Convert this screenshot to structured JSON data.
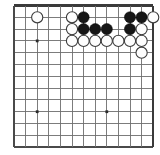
{
  "diagram": {
    "kind": "go-board-diagram",
    "board": {
      "columns": 13,
      "rows": 13,
      "origin_x": 14,
      "origin_y": 5.5,
      "spacing_x": 11.6,
      "spacing_y": 11.8,
      "line_color": "#6e6e6e",
      "edge_color": "#3a3a3a",
      "background_color": "#ffffff"
    },
    "star_points": [
      {
        "col": 2,
        "row": 3
      },
      {
        "col": 2,
        "row": 9
      },
      {
        "col": 8,
        "row": 9
      }
    ],
    "stone_radius": 5.6,
    "stones": [
      {
        "color": "white",
        "col": 2,
        "row": 1
      },
      {
        "color": "white",
        "col": 5,
        "row": 1
      },
      {
        "color": "black",
        "col": 6,
        "row": 1
      },
      {
        "color": "black",
        "col": 10,
        "row": 1
      },
      {
        "color": "black",
        "col": 11,
        "row": 1
      },
      {
        "color": "white",
        "col": 12,
        "row": 1
      },
      {
        "color": "white",
        "col": 5,
        "row": 2
      },
      {
        "color": "black",
        "col": 6,
        "row": 2
      },
      {
        "color": "black",
        "col": 7,
        "row": 2
      },
      {
        "color": "black",
        "col": 8,
        "row": 2
      },
      {
        "color": "black",
        "col": 10,
        "row": 2
      },
      {
        "color": "white",
        "col": 11,
        "row": 2
      },
      {
        "color": "white",
        "col": 5,
        "row": 3
      },
      {
        "color": "white",
        "col": 6,
        "row": 3
      },
      {
        "color": "white",
        "col": 7,
        "row": 3
      },
      {
        "color": "white",
        "col": 8,
        "row": 3
      },
      {
        "color": "white",
        "col": 9,
        "row": 3
      },
      {
        "color": "white",
        "col": 10,
        "row": 3
      },
      {
        "color": "white",
        "col": 11,
        "row": 3
      },
      {
        "color": "white",
        "col": 11,
        "row": 4
      }
    ],
    "stone_colors": {
      "black_fill": "#161616",
      "black_stroke": "#000000",
      "white_fill": "#fdfdfd",
      "white_stroke": "#3c3c3c"
    }
  }
}
